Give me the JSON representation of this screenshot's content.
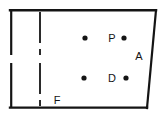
{
  "figure": {
    "background_color": "#ffffff",
    "stroke_color": "#141414",
    "point_color": "#141414",
    "label_color": "#141414",
    "width": 166,
    "height": 119,
    "outline": {
      "name": "quadrilateral-outline",
      "points": "11,10 156,10 147,108 11,108",
      "stroke_width": 2.2
    },
    "dashed_line": {
      "name": "vertical-dashed-line",
      "x": 40,
      "y_top": 11,
      "y_bottom": 107,
      "dash_pattern": "21 7",
      "stroke_width": 1.8
    },
    "scan_gap": {
      "name": "scan-fold-gap",
      "y_top": 55,
      "y_bottom": 63
    },
    "points": [
      {
        "name": "point-unlabeled-upper",
        "label": "",
        "cx": 85,
        "cy": 38,
        "r": 2.6
      },
      {
        "name": "point-p",
        "label": "P",
        "cx": 124,
        "cy": 38,
        "r": 2.6,
        "label_x": 112,
        "label_y": 42
      },
      {
        "name": "point-unlabeled-lower",
        "label": "",
        "cx": 84,
        "cy": 78,
        "r": 2.6
      },
      {
        "name": "point-d",
        "label": "D",
        "cx": 126,
        "cy": 78,
        "r": 2.6,
        "label_x": 112,
        "label_y": 82
      }
    ],
    "labels": [
      {
        "name": "label-p",
        "text": "P",
        "x": 112,
        "y": 42
      },
      {
        "name": "label-a",
        "text": "A",
        "x": 139,
        "y": 60
      },
      {
        "name": "label-d",
        "text": "D",
        "x": 112,
        "y": 82
      },
      {
        "name": "label-f",
        "text": "F",
        "x": 57,
        "y": 104
      }
    ]
  }
}
